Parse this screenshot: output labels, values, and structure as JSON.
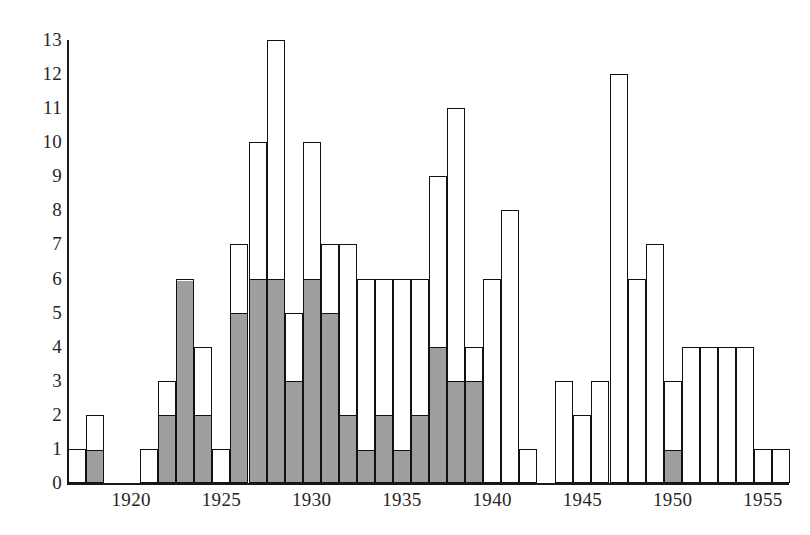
{
  "chart_data": {
    "type": "bar",
    "title": "",
    "subtitle": "",
    "xlabel": "",
    "ylabel": "",
    "grid": false,
    "legend_position": "none",
    "stacked": true,
    "xlim": [
      1916.5,
      1956.5
    ],
    "ylim": [
      0,
      13
    ],
    "yticks": [
      0,
      1,
      2,
      3,
      4,
      5,
      6,
      7,
      8,
      9,
      10,
      11,
      12,
      13
    ],
    "ytick_labels": [
      "0",
      "1",
      "2",
      "3",
      "4",
      "5",
      "6",
      "7",
      "8",
      "9",
      "10",
      "11",
      "12",
      "13"
    ],
    "xticks": [
      1920,
      1925,
      1930,
      1935,
      1940,
      1945,
      1950,
      1955
    ],
    "xtick_labels": [
      "1920",
      "1925",
      "1930",
      "1935",
      "1940",
      "1945",
      "1950",
      "1955"
    ],
    "categories": [
      1917,
      1918,
      1919,
      1920,
      1921,
      1922,
      1923,
      1924,
      1925,
      1926,
      1927,
      1928,
      1929,
      1930,
      1931,
      1932,
      1933,
      1934,
      1935,
      1936,
      1937,
      1938,
      1939,
      1940,
      1941,
      1942,
      1943,
      1944,
      1945,
      1946,
      1947,
      1948,
      1949,
      1950,
      1951,
      1952,
      1953,
      1954,
      1955,
      1956
    ],
    "series": [
      {
        "name": "shaded",
        "color": "#9e9e9e",
        "values": [
          0,
          1,
          0,
          0,
          0,
          2,
          6,
          2,
          0,
          5,
          6,
          6,
          3,
          6,
          5,
          2,
          1,
          2,
          1,
          2,
          4,
          3,
          3,
          0,
          0,
          0,
          0,
          0,
          0,
          0,
          0,
          0,
          0,
          1,
          0,
          0,
          0,
          0,
          0,
          0
        ]
      },
      {
        "name": "unshaded",
        "color": "#ffffff",
        "values": [
          1,
          1,
          0,
          0,
          1,
          1,
          0,
          2,
          1,
          2,
          4,
          7,
          2,
          4,
          2,
          5,
          5,
          4,
          5,
          4,
          5,
          8,
          1,
          6,
          8,
          1,
          0,
          3,
          2,
          3,
          12,
          6,
          7,
          2,
          4,
          4,
          4,
          4,
          1,
          1
        ]
      }
    ],
    "totals": [
      1,
      2,
      0,
      0,
      1,
      3,
      6,
      4,
      1,
      7,
      10,
      13,
      5,
      10,
      7,
      7,
      6,
      6,
      6,
      6,
      9,
      11,
      4,
      6,
      8,
      1,
      0,
      3,
      2,
      3,
      12,
      6,
      7,
      3,
      4,
      4,
      4,
      4,
      1,
      1
    ]
  },
  "axes": {
    "y_ticks": [
      "13",
      "12",
      "11",
      "10",
      "9",
      "8",
      "7",
      "6",
      "5",
      "4",
      "3",
      "2",
      "1",
      "0"
    ],
    "x_ticks": [
      "1920",
      "1925",
      "1930",
      "1935",
      "1940",
      "1945",
      "1950",
      "1955"
    ]
  },
  "colors": {
    "shaded_fill": "#9e9e9e",
    "unshaded_fill": "#ffffff",
    "outline": "#111111",
    "axis": "#1a1a1a",
    "background": "#ffffff"
  }
}
